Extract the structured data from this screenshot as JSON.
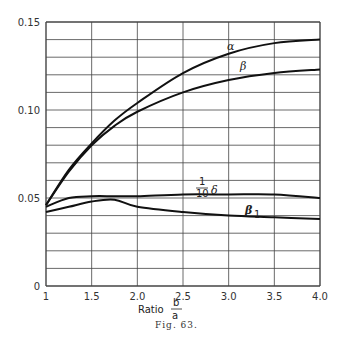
{
  "chart_data": {
    "type": "line",
    "title": "",
    "caption": "Fig. 63.",
    "xlabel": "Ratio b/a",
    "xlabel_text": "Ratio",
    "xlabel_num": "b",
    "xlabel_den": "a",
    "ylabel": "",
    "xlim": [
      1,
      4.0
    ],
    "ylim": [
      0,
      0.15
    ],
    "grid": true,
    "x_ticks": [
      1,
      1.5,
      2.0,
      2.5,
      3.0,
      3.5,
      4.0
    ],
    "x_tick_labels": [
      "1",
      "1.5",
      "2.0",
      "2.5",
      "3.0",
      "3.5",
      "4.0"
    ],
    "y_ticks": [
      0,
      0.05,
      0.1,
      0.15
    ],
    "y_tick_labels": [
      "0",
      "0.05",
      "0.10",
      "0.15"
    ],
    "y_minor_step": 0.01,
    "x": [
      1.0,
      1.25,
      1.5,
      1.75,
      2.0,
      2.5,
      3.0,
      3.5,
      4.0
    ],
    "series": [
      {
        "name": "α",
        "label_x": 2.9,
        "label_y": 0.128,
        "values": [
          0.046,
          0.066,
          0.081,
          0.094,
          0.104,
          0.121,
          0.132,
          0.138,
          0.14
        ]
      },
      {
        "name": "β",
        "label_x": 3.0,
        "label_y": 0.113,
        "values": [
          0.046,
          0.065,
          0.08,
          0.091,
          0.099,
          0.11,
          0.117,
          0.121,
          0.123
        ]
      },
      {
        "name": "1/10 δ",
        "label_x": 2.2,
        "label_y": 0.056,
        "values": [
          0.045,
          0.05,
          0.051,
          0.051,
          0.051,
          0.052,
          0.052,
          0.052,
          0.05
        ]
      },
      {
        "name": "β₁",
        "label_x": 3.0,
        "label_y": 0.042,
        "values": [
          0.042,
          0.045,
          0.048,
          0.049,
          0.045,
          0.042,
          0.04,
          0.039,
          0.038
        ]
      }
    ],
    "labels": {
      "alpha": "α",
      "beta": "β",
      "delta_num": "1",
      "delta_den": "10",
      "delta": "δ",
      "beta1": "β",
      "beta1_sub": "1"
    }
  }
}
